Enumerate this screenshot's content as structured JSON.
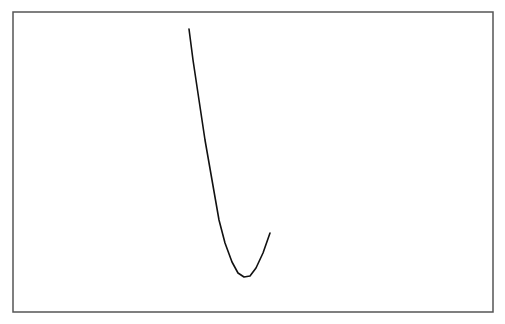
{
  "canvas": {
    "width": 505,
    "height": 324,
    "background": "#ffffff"
  },
  "frame": {
    "x": 13,
    "y": 12,
    "width": 480,
    "height": 300,
    "stroke": "#555555",
    "stroke_width": 1.5
  },
  "chart_data": {
    "type": "line",
    "title": "",
    "xlabel": "",
    "ylabel": "",
    "grid": false,
    "legend": null,
    "axes_visible": false,
    "series": [
      {
        "name": "curve",
        "color": "#111111",
        "points_px": [
          [
            189,
            29
          ],
          [
            193,
            60
          ],
          [
            199,
            100
          ],
          [
            205,
            140
          ],
          [
            212,
            180
          ],
          [
            219,
            220
          ],
          [
            225,
            243
          ],
          [
            232,
            262
          ],
          [
            238,
            273
          ],
          [
            244,
            277
          ],
          [
            250,
            276
          ],
          [
            256,
            268
          ],
          [
            263,
            253
          ],
          [
            270,
            233
          ]
        ]
      }
    ]
  }
}
